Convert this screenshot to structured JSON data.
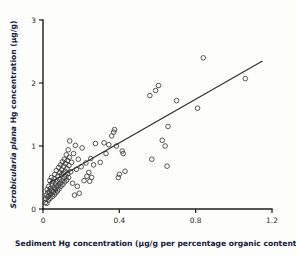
{
  "chart_data": {
    "type": "scatter",
    "title": "",
    "xlabel": "Sediment Hg concentration (µg/g per percentage organic content)",
    "ylabel_italic": "Scrobicularia plana",
    "ylabel_rest": " Hg concentration (µg/g)",
    "ylabel": "Scrobicularia plana Hg concentration (µg/g)",
    "xlim": [
      0,
      1.2
    ],
    "ylim": [
      0,
      3
    ],
    "xticks": [
      0,
      0.4,
      0.8,
      1.2
    ],
    "xticklabels": [
      "0",
      "0.4",
      "0.8",
      "1.2"
    ],
    "yticks": [
      0,
      1,
      2,
      3
    ],
    "yticklabels": [
      "0",
      "1",
      "2",
      "3"
    ],
    "grid": false,
    "legend": "none",
    "marker": "open-circle",
    "marker_color": "#3a3a3a",
    "line_color": "#2a2a2a",
    "series": [
      {
        "name": "Scrobicularia plana vs sediment Hg",
        "points": [
          [
            0.012,
            0.1
          ],
          [
            0.015,
            0.16
          ],
          [
            0.018,
            0.22
          ],
          [
            0.02,
            0.09
          ],
          [
            0.022,
            0.31
          ],
          [
            0.024,
            0.19
          ],
          [
            0.026,
            0.26
          ],
          [
            0.028,
            0.14
          ],
          [
            0.03,
            0.36
          ],
          [
            0.032,
            0.21
          ],
          [
            0.034,
            0.28
          ],
          [
            0.036,
            0.45
          ],
          [
            0.038,
            0.17
          ],
          [
            0.04,
            0.33
          ],
          [
            0.042,
            0.24
          ],
          [
            0.044,
            0.5
          ],
          [
            0.046,
            0.29
          ],
          [
            0.048,
            0.38
          ],
          [
            0.05,
            0.2
          ],
          [
            0.052,
            0.43
          ],
          [
            0.054,
            0.27
          ],
          [
            0.056,
            0.34
          ],
          [
            0.058,
            0.48
          ],
          [
            0.06,
            0.23
          ],
          [
            0.062,
            0.55
          ],
          [
            0.064,
            0.31
          ],
          [
            0.066,
            0.4
          ],
          [
            0.068,
            0.26
          ],
          [
            0.07,
            0.61
          ],
          [
            0.072,
            0.35
          ],
          [
            0.074,
            0.44
          ],
          [
            0.076,
            0.29
          ],
          [
            0.078,
            0.52
          ],
          [
            0.08,
            0.38
          ],
          [
            0.082,
            0.66
          ],
          [
            0.084,
            0.32
          ],
          [
            0.086,
            0.47
          ],
          [
            0.088,
            0.58
          ],
          [
            0.09,
            0.41
          ],
          [
            0.092,
            0.7
          ],
          [
            0.094,
            0.36
          ],
          [
            0.096,
            0.54
          ],
          [
            0.098,
            0.62
          ],
          [
            0.1,
            0.45
          ],
          [
            0.102,
            0.75
          ],
          [
            0.104,
            0.39
          ],
          [
            0.106,
            0.57
          ],
          [
            0.108,
            0.68
          ],
          [
            0.11,
            0.49
          ],
          [
            0.112,
            0.79
          ],
          [
            0.114,
            0.43
          ],
          [
            0.116,
            0.6
          ],
          [
            0.118,
            0.72
          ],
          [
            0.12,
            0.52
          ],
          [
            0.122,
            0.86
          ],
          [
            0.124,
            0.46
          ],
          [
            0.126,
            0.64
          ],
          [
            0.128,
            0.77
          ],
          [
            0.13,
            0.56
          ],
          [
            0.132,
            0.94
          ],
          [
            0.134,
            0.5
          ],
          [
            0.136,
            0.69
          ],
          [
            0.138,
            0.82
          ],
          [
            0.14,
            1.08
          ],
          [
            0.145,
            0.59
          ],
          [
            0.15,
            0.74
          ],
          [
            0.155,
            0.41
          ],
          [
            0.16,
            0.88
          ],
          [
            0.165,
            0.22
          ],
          [
            0.17,
            1.01
          ],
          [
            0.175,
            0.63
          ],
          [
            0.18,
            0.36
          ],
          [
            0.185,
            0.79
          ],
          [
            0.19,
            0.25
          ],
          [
            0.2,
            0.67
          ],
          [
            0.205,
            0.97
          ],
          [
            0.215,
            0.45
          ],
          [
            0.225,
            0.73
          ],
          [
            0.23,
            0.52
          ],
          [
            0.24,
            0.58
          ],
          [
            0.245,
            0.44
          ],
          [
            0.25,
            0.8
          ],
          [
            0.255,
            0.5
          ],
          [
            0.265,
            0.7
          ],
          [
            0.275,
            1.04
          ],
          [
            0.3,
            0.74
          ],
          [
            0.32,
            1.05
          ],
          [
            0.33,
            0.88
          ],
          [
            0.345,
            1.02
          ],
          [
            0.36,
            1.16
          ],
          [
            0.37,
            1.22
          ],
          [
            0.375,
            1.26
          ],
          [
            0.385,
            1.0
          ],
          [
            0.395,
            0.5
          ],
          [
            0.4,
            0.55
          ],
          [
            0.415,
            0.92
          ],
          [
            0.42,
            0.88
          ],
          [
            0.43,
            0.6
          ],
          [
            0.56,
            1.8
          ],
          [
            0.57,
            0.79
          ],
          [
            0.59,
            1.88
          ],
          [
            0.605,
            1.96
          ],
          [
            0.625,
            1.09
          ],
          [
            0.64,
            1.0
          ],
          [
            0.65,
            0.68
          ],
          [
            0.655,
            1.31
          ],
          [
            0.7,
            1.72
          ],
          [
            0.81,
            1.6
          ],
          [
            0.84,
            2.4
          ],
          [
            1.06,
            2.07
          ]
        ]
      }
    ],
    "fit_line": {
      "name": "regression-line",
      "x_start": 0.03,
      "y_start": 0.41,
      "x_end": 1.15,
      "y_end": 2.35
    }
  },
  "geometry": {
    "plot_left": 43,
    "plot_right": 272,
    "plot_top": 20,
    "plot_bottom": 209
  }
}
